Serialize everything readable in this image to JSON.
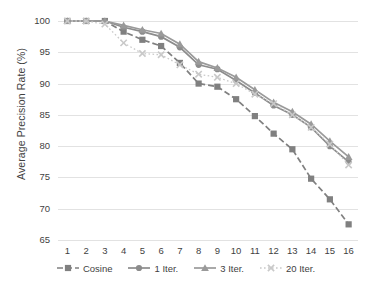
{
  "chart_data": {
    "type": "line",
    "title": "",
    "xlabel": "",
    "ylabel": "Average Precision Rate (%)",
    "categories": [
      "1",
      "2",
      "3",
      "4",
      "5",
      "6",
      "7",
      "8",
      "9",
      "10",
      "11",
      "12",
      "13",
      "14",
      "15",
      "16"
    ],
    "xlim": [
      1,
      16
    ],
    "ylim": [
      65,
      100
    ],
    "yticks": [
      65,
      70,
      75,
      80,
      85,
      90,
      95,
      100
    ],
    "grid": true,
    "legend_position": "bottom",
    "series": [
      {
        "name": "Cosine",
        "marker": "square",
        "line_style": "dashed",
        "color": "#808080",
        "values": [
          100,
          100,
          100,
          98.3,
          97.0,
          96.0,
          93.3,
          90.0,
          89.5,
          87.5,
          84.8,
          82.0,
          79.5,
          74.8,
          71.5,
          67.5
        ]
      },
      {
        "name": "1 Iter.",
        "marker": "circle",
        "line_style": "solid",
        "color": "#8c8c8c",
        "values": [
          100,
          100,
          100,
          99.0,
          98.3,
          97.5,
          95.8,
          93.0,
          92.3,
          90.5,
          88.5,
          86.5,
          85.0,
          83.0,
          80.0,
          77.5
        ]
      },
      {
        "name": "3 Iter.",
        "marker": "triangle",
        "line_style": "solid",
        "color": "#9a9a9a",
        "values": [
          100,
          100,
          100,
          99.3,
          98.6,
          98.0,
          96.3,
          93.5,
          92.5,
          91.0,
          89.0,
          87.0,
          85.5,
          83.5,
          80.8,
          78.3
        ]
      },
      {
        "name": "20 Iter.",
        "marker": "x",
        "line_style": "dotted",
        "color": "#c9c9c9",
        "values": [
          100,
          100,
          99.5,
          96.5,
          94.8,
          94.6,
          93.0,
          91.5,
          91.0,
          90.0,
          88.3,
          86.8,
          85.0,
          83.0,
          80.3,
          77.0
        ]
      }
    ]
  }
}
